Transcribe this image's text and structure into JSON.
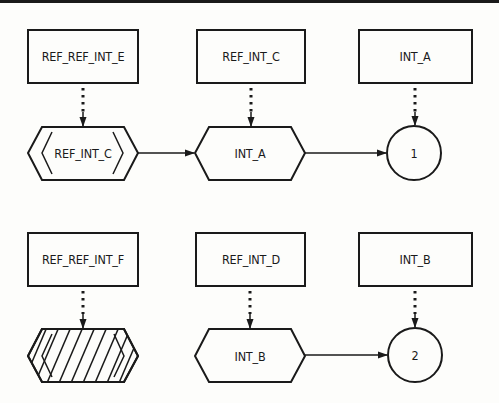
{
  "diagram": {
    "type": "flow-notation",
    "colors": {
      "ink": "#1a1a1a",
      "paper": "#fdfdfb"
    },
    "row1": {
      "box1": "REF_REF_INT_E",
      "box2": "REF_INT_C",
      "box3": "INT_A",
      "hex1": "REF_INT_C",
      "hex1_style": "double-bracketed",
      "hex2": "INT_A",
      "connector": "1"
    },
    "row2": {
      "box1": "REF_REF_INT_F",
      "box2": "REF_INT_D",
      "box3": "INT_B",
      "hex1": "",
      "hex1_style": "hatched",
      "hex2": "INT_B",
      "connector": "2"
    },
    "edges": [
      {
        "from": "REF_REF_INT_E",
        "to": "REF_INT_C (hexagon)",
        "style": "dotted"
      },
      {
        "from": "REF_INT_C",
        "to": "INT_A (hexagon)",
        "style": "dotted"
      },
      {
        "from": "INT_A",
        "to": "1",
        "style": "dotted"
      },
      {
        "from": "REF_INT_C (hexagon)",
        "to": "INT_A (hexagon)",
        "style": "solid"
      },
      {
        "from": "INT_A (hexagon)",
        "to": "1",
        "style": "solid"
      },
      {
        "from": "REF_REF_INT_F",
        "to": "hatched hexagon",
        "style": "dotted"
      },
      {
        "from": "REF_INT_D",
        "to": "INT_B (hexagon)",
        "style": "dotted"
      },
      {
        "from": "INT_B",
        "to": "2",
        "style": "dotted"
      },
      {
        "from": "INT_B (hexagon)",
        "to": "2",
        "style": "solid"
      }
    ]
  }
}
